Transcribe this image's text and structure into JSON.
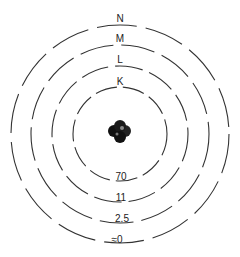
{
  "diagram": {
    "shells": [
      {
        "name": "K",
        "value": "70"
      },
      {
        "name": "L",
        "value": "11"
      },
      {
        "name": "M",
        "value": "2.5"
      },
      {
        "name": "N",
        "value": "≈0"
      }
    ],
    "nucleus": "nucleus",
    "colors": {
      "line": "#333333",
      "nucleus": "#111111",
      "background": "#ffffff"
    }
  }
}
